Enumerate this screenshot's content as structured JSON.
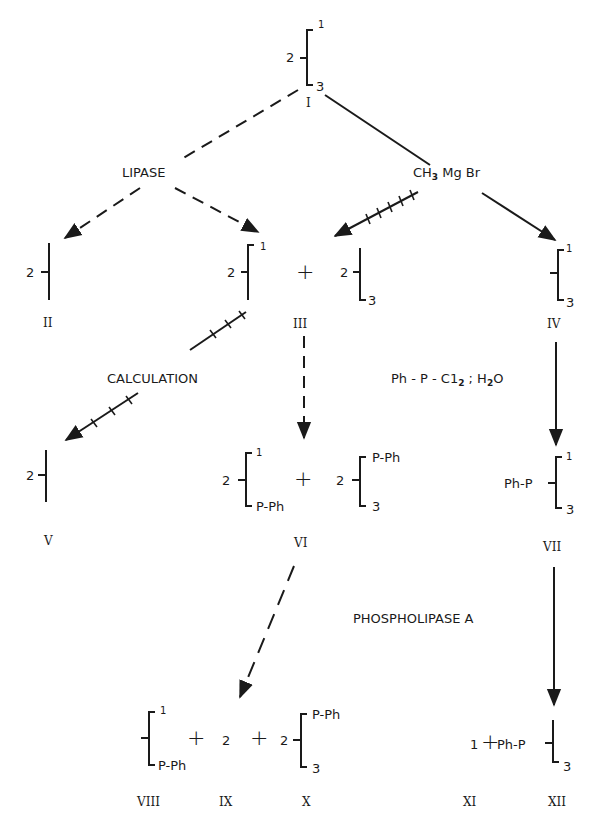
{
  "header": {
    "clipped_text": ""
  },
  "compounds": {
    "I": {
      "label": "I",
      "pos2": "2",
      "pos1": "1",
      "pos3": "3"
    },
    "II": {
      "label": "II",
      "pos2": "2"
    },
    "III": {
      "label": "III",
      "a_pos2": "2",
      "a_pos1": "1",
      "b_pos2": "2",
      "b_pos3": "3"
    },
    "IV": {
      "label": "IV",
      "pos1": "1",
      "pos3": "3"
    },
    "V": {
      "label": "V",
      "pos2": "2"
    },
    "VI": {
      "label": "VI",
      "a_pos2": "2",
      "a_pos1": "1",
      "a_sub": "P-Ph",
      "b_pos2": "2",
      "b_sub": "P-Ph",
      "b_pos3": "3"
    },
    "VII": {
      "label": "VII",
      "prefix": "Ph-P",
      "pos1": "1",
      "pos3": "3"
    },
    "VIII": {
      "label": "VIII",
      "pos1": "1",
      "sub": "P-Ph"
    },
    "IX": {
      "label": "IX",
      "value": "2"
    },
    "X": {
      "label": "X",
      "pos2": "2",
      "sub": "P-Ph",
      "pos3": "3"
    },
    "XI": {
      "label": "XI",
      "value": "1"
    },
    "XII": {
      "label": "XII",
      "prefix": "Ph-P",
      "pos3": "3"
    }
  },
  "reagents": {
    "lipase": "LIPASE",
    "grignard": "CH",
    "grignard_sub": "3",
    "grignard_rest": " Mg Br",
    "calculation": "CALCULATION",
    "phosphorylation_a": "Ph - P - C1",
    "phosphorylation_sub1": "2",
    "phosphorylation_b": " ; H",
    "phosphorylation_sub2": "2",
    "phosphorylation_c": "O",
    "phospholipase": "PHOSPHOLIPASE  A"
  },
  "operators": {
    "plus": "+"
  },
  "legend": {
    "dashed_arrow": "enzymatic / lipase path",
    "solid_arrow": "chemical path",
    "hatched_arrow": "calculated path"
  },
  "colors": {
    "ink": "#1a1a1a",
    "background": "#ffffff"
  }
}
